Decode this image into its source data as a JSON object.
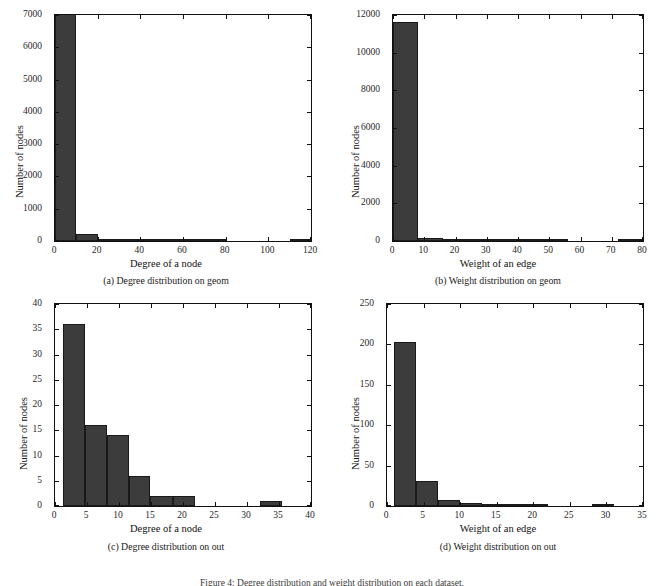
{
  "figure": {
    "caption": "Figure 4: Degree distribution and weight distribution on each dataset.",
    "bar_color": "#3c3c3c",
    "axis_color": "#111111"
  },
  "panels": [
    {
      "key": "a",
      "subcaption": "(a)  Degree distribution on geom",
      "ylabel": "Number of nodes",
      "xlabel": "Degree of a node",
      "xticks": [
        "0",
        "20",
        "40",
        "60",
        "80",
        "100",
        "120"
      ],
      "yticks": [
        "0",
        "1000",
        "2000",
        "3000",
        "4000",
        "5000",
        "6000",
        "7000"
      ]
    },
    {
      "key": "b",
      "subcaption": "(b)  Weight distribution on geom",
      "ylabel": "Number of nodes",
      "xlabel": "Weight of an edge",
      "xticks": [
        "0",
        "10",
        "20",
        "30",
        "40",
        "50",
        "60",
        "70",
        "80"
      ],
      "yticks": [
        "0",
        "2000",
        "4000",
        "6000",
        "8000",
        "10000",
        "12000"
      ]
    },
    {
      "key": "c",
      "subcaption": "(c)  Degree distribution on out",
      "ylabel": "Number of nodes",
      "xlabel": "Degree of a node",
      "xticks": [
        "0",
        "5",
        "10",
        "15",
        "20",
        "25",
        "30",
        "35",
        "40"
      ],
      "yticks": [
        "0",
        "5",
        "10",
        "15",
        "20",
        "25",
        "30",
        "35",
        "40"
      ]
    },
    {
      "key": "d",
      "subcaption": "(d)  Weight distribution on out",
      "ylabel": "Number of nodes",
      "xlabel": "Weight of an edge",
      "xticks": [
        "0",
        "5",
        "10",
        "15",
        "20",
        "25",
        "30",
        "35"
      ],
      "yticks": [
        "0",
        "50",
        "100",
        "150",
        "200",
        "250"
      ]
    }
  ],
  "chart_data": [
    {
      "type": "bar",
      "panel": "a",
      "title": "(a) Degree distribution on geom",
      "xlabel": "Degree of a node",
      "ylabel": "Number of nodes",
      "xlim": [
        0,
        120
      ],
      "ylim": [
        0,
        7000
      ],
      "xticks": [
        0,
        20,
        40,
        60,
        80,
        100,
        120
      ],
      "yticks": [
        0,
        1000,
        2000,
        3000,
        4000,
        5000,
        6000,
        7000
      ],
      "grid": false,
      "legend": null,
      "bin_edges": [
        0,
        10,
        20,
        30,
        40,
        50,
        60,
        70,
        80,
        90,
        100,
        110,
        120
      ],
      "values": [
        7000,
        210,
        55,
        22,
        10,
        5,
        3,
        1,
        0,
        0,
        0,
        1
      ]
    },
    {
      "type": "bar",
      "panel": "b",
      "title": "(b) Weight distribution on geom",
      "xlabel": "Weight of an edge",
      "ylabel": "Number of nodes",
      "xlim": [
        0,
        80
      ],
      "ylim": [
        0,
        12000
      ],
      "xticks": [
        0,
        10,
        20,
        30,
        40,
        50,
        60,
        70,
        80
      ],
      "yticks": [
        0,
        2000,
        4000,
        6000,
        8000,
        10000,
        12000
      ],
      "grid": false,
      "legend": null,
      "bin_edges": [
        0,
        8,
        16,
        24,
        32,
        40,
        48,
        56,
        64,
        72,
        80
      ],
      "values": [
        11650,
        170,
        30,
        10,
        5,
        2,
        1,
        0,
        0,
        8
      ]
    },
    {
      "type": "bar",
      "panel": "c",
      "title": "(c) Degree distribution on out",
      "xlabel": "Degree of a node",
      "ylabel": "Number of nodes",
      "xlim": [
        0,
        40
      ],
      "ylim": [
        0,
        40
      ],
      "xticks": [
        0,
        5,
        10,
        15,
        20,
        25,
        30,
        35,
        40
      ],
      "yticks": [
        0,
        5,
        10,
        15,
        20,
        25,
        30,
        35,
        40
      ],
      "grid": false,
      "legend": null,
      "bin_edges": [
        1.3,
        4.7,
        8.1,
        11.5,
        14.9,
        18.4,
        21.8,
        25.2,
        28.6,
        32.1,
        35.5
      ],
      "values": [
        36,
        16,
        14,
        6,
        2,
        2,
        0,
        0,
        0,
        1
      ]
    },
    {
      "type": "bar",
      "panel": "d",
      "title": "(d) Weight distribution on out",
      "xlabel": "Weight of an edge",
      "ylabel": "Number of nodes",
      "xlim": [
        0,
        35
      ],
      "ylim": [
        0,
        250
      ],
      "xticks": [
        0,
        5,
        10,
        15,
        20,
        25,
        30,
        35
      ],
      "yticks": [
        0,
        50,
        100,
        150,
        200,
        250
      ],
      "grid": false,
      "legend": null,
      "bin_edges": [
        1.0,
        4.0,
        7.0,
        10.0,
        13.0,
        16.0,
        19.0,
        22.0,
        25.0,
        28.0,
        31.0
      ],
      "values": [
        203,
        31,
        7,
        4,
        1,
        2,
        1,
        0,
        0,
        1
      ]
    }
  ]
}
